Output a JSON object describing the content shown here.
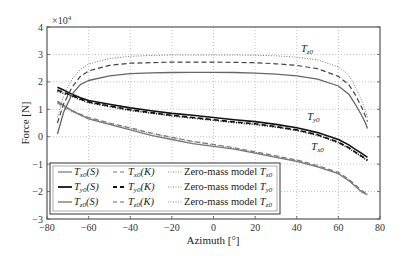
{
  "chart_data": {
    "type": "line",
    "title": "",
    "xlabel": "Azimuth [°]",
    "ylabel": "Force [N]",
    "y_multiplier": "×10⁴",
    "xlim": [
      -80,
      80
    ],
    "ylim": [
      -3,
      4
    ],
    "xticks": [
      -80,
      -60,
      -40,
      -20,
      0,
      20,
      40,
      60,
      80
    ],
    "yticks": [
      -3,
      -2,
      -1,
      0,
      1,
      2,
      3,
      4
    ],
    "grid": true,
    "legend_position": "lower left",
    "annotations": [
      {
        "text": "T_z0",
        "x": 42,
        "y": 3.1
      },
      {
        "text": "T_y0",
        "x": 45,
        "y": 0.6
      },
      {
        "text": "T_x0",
        "x": 47,
        "y": -0.5
      }
    ],
    "x": [
      -75,
      -72,
      -68,
      -64,
      -60,
      -50,
      -40,
      -30,
      -20,
      -10,
      0,
      10,
      20,
      30,
      40,
      50,
      60,
      65,
      68,
      71,
      73,
      74
    ],
    "series": [
      {
        "name": "T_x0 (S)",
        "style": "solid",
        "color": "#777777",
        "values": [
          1.3,
          1.15,
          0.95,
          0.8,
          0.65,
          0.45,
          0.25,
          0.05,
          -0.1,
          -0.25,
          -0.35,
          -0.45,
          -0.6,
          -0.75,
          -0.9,
          -1.1,
          -1.35,
          -1.6,
          -1.8,
          -2.0,
          -2.08,
          -2.1
        ]
      },
      {
        "name": "T_y0 (S)",
        "style": "solid",
        "color": "#111111",
        "values": [
          1.8,
          1.7,
          1.55,
          1.42,
          1.32,
          1.18,
          1.05,
          0.95,
          0.85,
          0.78,
          0.7,
          0.62,
          0.55,
          0.45,
          0.33,
          0.15,
          -0.1,
          -0.3,
          -0.45,
          -0.6,
          -0.7,
          -0.75
        ]
      },
      {
        "name": "T_z0 (S)",
        "style": "solid",
        "color": "#666666",
        "values": [
          0.1,
          0.9,
          1.55,
          1.9,
          2.05,
          2.22,
          2.3,
          2.33,
          2.34,
          2.35,
          2.35,
          2.34,
          2.32,
          2.28,
          2.22,
          2.1,
          1.85,
          1.55,
          1.2,
          0.8,
          0.5,
          0.3
        ]
      },
      {
        "name": "T_x0 (K)",
        "style": "dashed",
        "color": "#777777",
        "values": [
          1.25,
          1.1,
          0.95,
          0.82,
          0.7,
          0.5,
          0.32,
          0.13,
          -0.02,
          -0.17,
          -0.28,
          -0.4,
          -0.55,
          -0.7,
          -0.85,
          -1.05,
          -1.3,
          -1.55,
          -1.75,
          -1.95,
          -2.05,
          -2.08
        ]
      },
      {
        "name": "T_y0 (K)",
        "style": "dashed",
        "color": "#111111",
        "values": [
          1.7,
          1.62,
          1.5,
          1.38,
          1.27,
          1.12,
          0.98,
          0.88,
          0.78,
          0.7,
          0.62,
          0.54,
          0.47,
          0.37,
          0.25,
          0.07,
          -0.2,
          -0.4,
          -0.55,
          -0.7,
          -0.8,
          -0.85
        ]
      },
      {
        "name": "T_z0 (K)",
        "style": "dashed",
        "color": "#444444",
        "values": [
          0.5,
          1.2,
          1.8,
          2.2,
          2.4,
          2.6,
          2.68,
          2.7,
          2.72,
          2.72,
          2.72,
          2.71,
          2.7,
          2.66,
          2.6,
          2.48,
          2.2,
          1.9,
          1.55,
          1.1,
          0.75,
          0.55
        ]
      },
      {
        "name": "Zero-mass model T_x0",
        "style": "dotted",
        "color": "#777777",
        "values": [
          1.2,
          1.05,
          0.9,
          0.78,
          0.68,
          0.48,
          0.3,
          0.12,
          -0.03,
          -0.18,
          -0.3,
          -0.42,
          -0.57,
          -0.72,
          -0.88,
          -1.08,
          -1.35,
          -1.6,
          -1.8,
          -2.0,
          -2.1,
          -2.12
        ]
      },
      {
        "name": "Zero-mass model T_y0",
        "style": "dotted",
        "color": "#111111",
        "values": [
          1.65,
          1.58,
          1.47,
          1.35,
          1.24,
          1.1,
          0.96,
          0.86,
          0.76,
          0.68,
          0.6,
          0.52,
          0.45,
          0.35,
          0.23,
          0.05,
          -0.22,
          -0.42,
          -0.57,
          -0.72,
          -0.82,
          -0.88
        ]
      },
      {
        "name": "Zero-mass model T_z0",
        "style": "dotted",
        "color": "#777777",
        "values": [
          0.7,
          1.5,
          2.1,
          2.45,
          2.65,
          2.85,
          2.93,
          2.96,
          2.98,
          2.98,
          2.98,
          2.98,
          2.97,
          2.95,
          2.9,
          2.8,
          2.55,
          2.25,
          1.85,
          1.35,
          0.95,
          0.7
        ]
      }
    ]
  },
  "legend": {
    "col1": [
      "T_x0(S)",
      "T_y0(S)",
      "T_z0(S)"
    ],
    "col2": [
      "T_x0(K)",
      "T_y0(K)",
      "T_z0(K)"
    ],
    "col3": [
      "Zero-mass model T_x0",
      "Zero-mass model T_y0",
      "Zero-mass model T_z0"
    ]
  },
  "axes": {
    "xlabel_text": "Azimuth [°]",
    "ylabel_text": "Force [N]",
    "multiplier_text": "×10",
    "multiplier_exp": "4"
  },
  "text": {
    "legend_prefix": "Zero-mass model",
    "paren_S": "(S)",
    "paren_K": "(K)"
  }
}
